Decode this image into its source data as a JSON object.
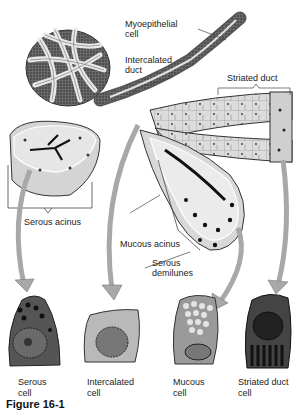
{
  "diagram": {
    "type": "anatomical illustration",
    "colors": {
      "background": "#ffffff",
      "tissue_fill": "#d9d9d9",
      "tissue_dark": "#3a3a3a",
      "arrow_fill": "#a8a8a8",
      "label_text": "#222222"
    },
    "structure_labels": {
      "myoepithelial_cell": "Myoepithelial\ncell",
      "intercalated_duct": "Intercalated\nduct",
      "striated_duct": "Striated duct",
      "serous_acinus": "Serous acinus",
      "mucous_acinus": "Mucous acinus",
      "serous_demilunes": "Serous\ndemilunes"
    },
    "cell_captions": [
      {
        "label": "Serous\ncell"
      },
      {
        "label": "Intercalated\ncell"
      },
      {
        "label": "Mucous\ncell"
      },
      {
        "label": "Striated duct\ncell"
      }
    ],
    "figure_caption": "Figure 16-1"
  }
}
